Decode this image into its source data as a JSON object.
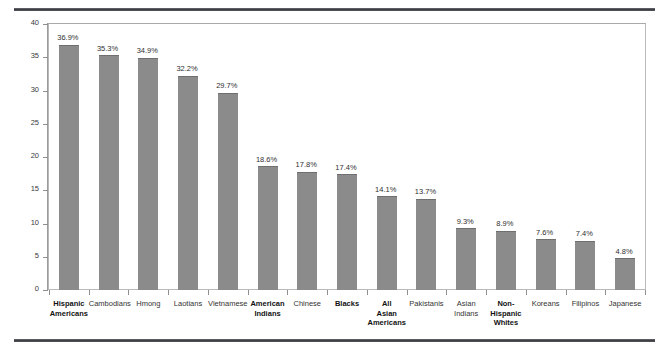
{
  "chart_data": {
    "type": "bar",
    "title": "",
    "subtitle": "",
    "xlabel": "",
    "ylabel": "Percentage",
    "ylim": [
      0,
      40
    ],
    "yticks": [
      0,
      5,
      10,
      15,
      20,
      25,
      30,
      35,
      40
    ],
    "ytick_labels": [
      "0",
      "5",
      "10",
      "15",
      "20",
      "25",
      "30",
      "35",
      "40"
    ],
    "grid": false,
    "legend": "none",
    "bar_color": "#8b8b8b",
    "categories": [
      "Hispanic Americans",
      "Cambodians",
      "Hmong",
      "Laotians",
      "Vietnamese",
      "American Indians",
      "Chinese",
      "Blacks",
      "All Asian Americans",
      "Pakistanis",
      "Asian Indians",
      "Non-Hispanic Whites",
      "Koreans",
      "Filipinos",
      "Japanese"
    ],
    "values": [
      36.9,
      35.3,
      34.9,
      32.2,
      29.7,
      18.6,
      17.8,
      17.4,
      14.1,
      13.7,
      9.3,
      8.9,
      7.6,
      7.4,
      4.8
    ],
    "data_labels": [
      "36.9%",
      "35.3%",
      "34.9%",
      "32.2%",
      "29.7%",
      "18.6%",
      "17.8%",
      "17.4%",
      "14.1%",
      "13.7%",
      "9.3%",
      "8.9%",
      "7.6%",
      "7.4%",
      "4.8%"
    ],
    "category_lines": [
      [
        "Hispanic",
        "Americans"
      ],
      [
        "Cambodians"
      ],
      [
        "Hmong"
      ],
      [
        "Laotians"
      ],
      [
        "Vietnamese"
      ],
      [
        "American",
        "Indians"
      ],
      [
        "Chinese"
      ],
      [
        "Blacks"
      ],
      [
        "All",
        "Asian",
        "Americans"
      ],
      [
        "Pakistanis"
      ],
      [
        "Asian",
        "Indians"
      ],
      [
        "Non-",
        "Hispanic",
        "Whites"
      ],
      [
        "Koreans"
      ],
      [
        "Filipinos"
      ],
      [
        "Japanese"
      ]
    ],
    "emphasized": [
      true,
      false,
      false,
      false,
      false,
      true,
      false,
      true,
      true,
      false,
      false,
      true,
      false,
      false,
      false
    ]
  }
}
